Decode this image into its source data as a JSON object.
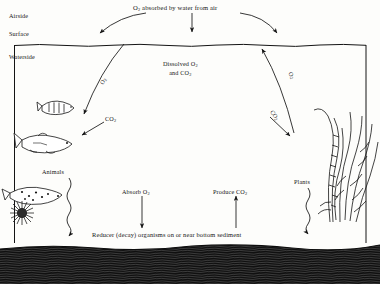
{
  "diagram": {
    "title": "O2 absorbed by water from air",
    "zones": {
      "airside": "Airside",
      "surface": "Surface",
      "waterside": "Waterside"
    },
    "labels": {
      "dissolved_line1": "Dissolved O2",
      "dissolved_line2": "and CO2",
      "co2_left": "CO2",
      "o2_left_arrow": "O2",
      "o2_right_arrow": "O2",
      "co2_right_arrow": "CO2",
      "animals": "Animals",
      "plants": "Plants",
      "absorb_o2": "Absorb O2",
      "produce_co2": "Produce CO2",
      "reducer": "Reducer (decay) organisms on or near bottom sediment"
    },
    "colors": {
      "ink": "#141414",
      "paper": "#fdfdfb",
      "sediment": "#121212"
    }
  }
}
